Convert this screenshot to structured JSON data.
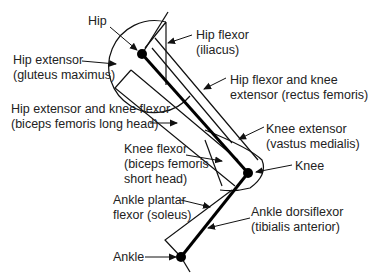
{
  "diagram": {
    "type": "leg-muscle-diagram",
    "joints": [
      {
        "name": "Hip",
        "x": 142,
        "y": 54
      },
      {
        "name": "Knee",
        "x": 248,
        "y": 173
      },
      {
        "name": "Ankle",
        "x": 181,
        "y": 257
      }
    ]
  },
  "labels": {
    "hip": "Hip",
    "hip_extensor": {
      "line1": "Hip extensor",
      "line2": "(gluteus maximus)"
    },
    "hip_ext_knee_flex": {
      "line1": "Hip extensor and knee flexor",
      "line2": "(biceps femoris long head)"
    },
    "knee_flexor": {
      "line1": "Knee flexor",
      "line2": "(biceps femoris",
      "line3": "short head)"
    },
    "ankle_plantar": {
      "line1": "Ankle plantar",
      "line2": "flexor (soleus)"
    },
    "ankle": "Ankle",
    "hip_flexor": {
      "line1": "Hip flexor",
      "line2": "(iliacus)"
    },
    "hip_flex_knee_ext": {
      "line1": "Hip flexor and knee",
      "line2": "extensor (rectus femoris)"
    },
    "knee_extensor": {
      "line1": "Knee extensor",
      "line2": "(vastus medialis)"
    },
    "knee": "Knee",
    "ankle_dorsi": {
      "line1": "Ankle dorsiflexor",
      "line2": "(tibialis anterior)"
    }
  }
}
